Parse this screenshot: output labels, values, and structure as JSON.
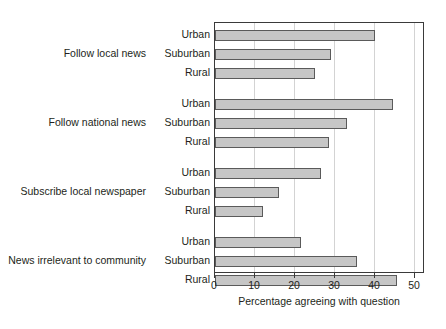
{
  "chart_data": {
    "type": "bar",
    "orientation": "horizontal",
    "title": "",
    "xlabel": "Percentage agreeing with question",
    "ylabel": "",
    "xlim": [
      0,
      52.5
    ],
    "xticks": [
      0,
      10,
      20,
      30,
      40,
      50
    ],
    "xtick_labels": [
      "0",
      "10",
      "20",
      "30",
      "40",
      "50"
    ],
    "grid": "vertical",
    "legend": "none",
    "subcategories": [
      "Urban",
      "Suburban",
      "Rural"
    ],
    "groups": [
      {
        "label": "Follow local news",
        "bars": [
          {
            "name": "Urban",
            "value": 40.0
          },
          {
            "name": "Suburban",
            "value": 29.0
          },
          {
            "name": "Rural",
            "value": 25.0
          }
        ]
      },
      {
        "label": "Follow national news",
        "bars": [
          {
            "name": "Urban",
            "value": 44.5
          },
          {
            "name": "Suburban",
            "value": 33.0
          },
          {
            "name": "Rural",
            "value": 28.5
          }
        ]
      },
      {
        "label": "Subscribe local newspaper",
        "bars": [
          {
            "name": "Urban",
            "value": 26.5
          },
          {
            "name": "Suburban",
            "value": 16.0
          },
          {
            "name": "Rural",
            "value": 12.0
          }
        ]
      },
      {
        "label": "News irrelevant to community",
        "bars": [
          {
            "name": "Urban",
            "value": 21.5
          },
          {
            "name": "Suburban",
            "value": 35.5
          },
          {
            "name": "Rural",
            "value": 45.5
          }
        ]
      }
    ],
    "colors": {
      "bar_fill": "#c6c6c6",
      "bar_stroke": "#5a5a5a",
      "gridline": "#d3d3d3",
      "frame": "#3a3a3a",
      "text": "#231f20",
      "background": "#ffffff"
    }
  }
}
